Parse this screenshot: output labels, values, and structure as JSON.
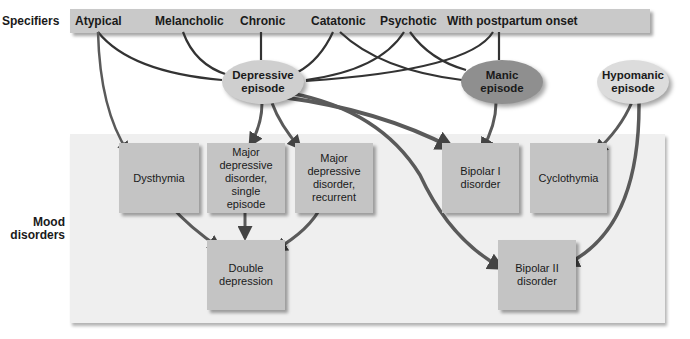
{
  "row_labels": {
    "specifiers": "Specifiers",
    "mood_disorders_line1": "Mood",
    "mood_disorders_line2": "disorders"
  },
  "specifiers": [
    {
      "label": "Atypical"
    },
    {
      "label": "Melancholic"
    },
    {
      "label": "Chronic"
    },
    {
      "label": "Catatonic"
    },
    {
      "label": "Psychotic"
    },
    {
      "label": "With postpartum onset"
    }
  ],
  "episodes": {
    "depressive": {
      "line1": "Depressive",
      "line2": "episode"
    },
    "manic": {
      "line1": "Manic",
      "line2": "episode"
    },
    "hypomanic": {
      "line1": "Hypomanic",
      "line2": "episode"
    }
  },
  "disorders": {
    "dysthymia": {
      "line1": "Dysthymia"
    },
    "mdd_single": {
      "line1": "Major",
      "line2": "depressive",
      "line3": "disorder,",
      "line4": "single",
      "line5": "episode"
    },
    "mdd_recurrent": {
      "line1": "Major",
      "line2": "depressive",
      "line3": "disorder,",
      "line4": "recurrent"
    },
    "bipolar1": {
      "line1": "Bipolar I",
      "line2": "disorder"
    },
    "cyclothymia": {
      "line1": "Cyclothymia"
    },
    "double_depression": {
      "line1": "Double",
      "line2": "depression"
    },
    "bipolar2": {
      "line1": "Bipolar II",
      "line2": "disorder"
    }
  },
  "colors": {
    "specifier_bar": "#c9c9c9",
    "mood_panel": "#efefef",
    "box": "#c4c4c4",
    "depressive_episode": "#cfcfcf",
    "manic_episode": "#8f8f8f",
    "hypomanic_episode": "#dcdcdc",
    "line": "#333333",
    "arrow": "#555555"
  }
}
